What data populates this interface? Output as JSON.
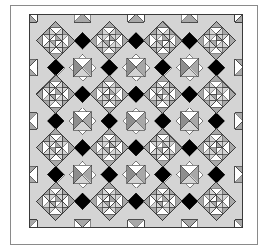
{
  "figure": {
    "name": "quilt-pattern-diagram",
    "canvas": {
      "width": 268,
      "height": 250
    },
    "background_color": "#ffffff"
  },
  "palette": {
    "white": "#ffffff",
    "light_gray": "#d4d4d4",
    "mid_gray": "#a8a8a8",
    "dark_gray": "#8e8e8e",
    "black": "#000000",
    "outline": "#3a3a3a",
    "frame_line": "#8a8a8a",
    "border_fill": "#ffffff"
  },
  "outer_frame": {
    "name": "quilt-outer-border",
    "x": 10,
    "y": 5,
    "width": 248,
    "height": 240,
    "stroke": "#8a8a8a",
    "stroke_width": 1,
    "fill": "#ffffff"
  },
  "inner_field": {
    "name": "quilt-pieced-field",
    "x": 29,
    "y": 14,
    "width": 214,
    "height": 214,
    "stroke": "#3a3a3a",
    "fill": "#d4d4d4"
  },
  "grid": {
    "columns": 4,
    "rows": 4,
    "cell_size": 53.5,
    "layout": "on-point diagonal set",
    "description": "Four by four grid of on-point star blocks joined by a diagonal light sashing lattice with black setting squares."
  },
  "blocks": {
    "star_block": {
      "name": "on-point-star-block",
      "center_motif": "pinwheel",
      "ring_units": 8,
      "unit_type": "half-square-triangle",
      "corner_fill": "#d4d4d4"
    },
    "lattice_node": {
      "name": "sashing-intersection-pinwheel",
      "motif": "small-pinwheel",
      "size": 26
    },
    "setting_square": {
      "name": "black-setting-square",
      "fill": "#000000",
      "shape": "diamond"
    },
    "edge_unit": {
      "name": "edge-triangle-unit",
      "unit_type": "hourglass-x-block"
    }
  },
  "chart_data": {
    "type": "diagram",
    "patch_counts": {
      "star_blocks": 16,
      "lattice_pinwheels": 9,
      "setting_squares": 24,
      "edge_units": 28
    },
    "fabric_legend": [
      {
        "label": "White",
        "color": "#ffffff"
      },
      {
        "label": "Light gray",
        "color": "#d4d4d4"
      },
      {
        "label": "Medium gray",
        "color": "#a8a8a8"
      },
      {
        "label": "Black",
        "color": "#000000"
      }
    ]
  }
}
